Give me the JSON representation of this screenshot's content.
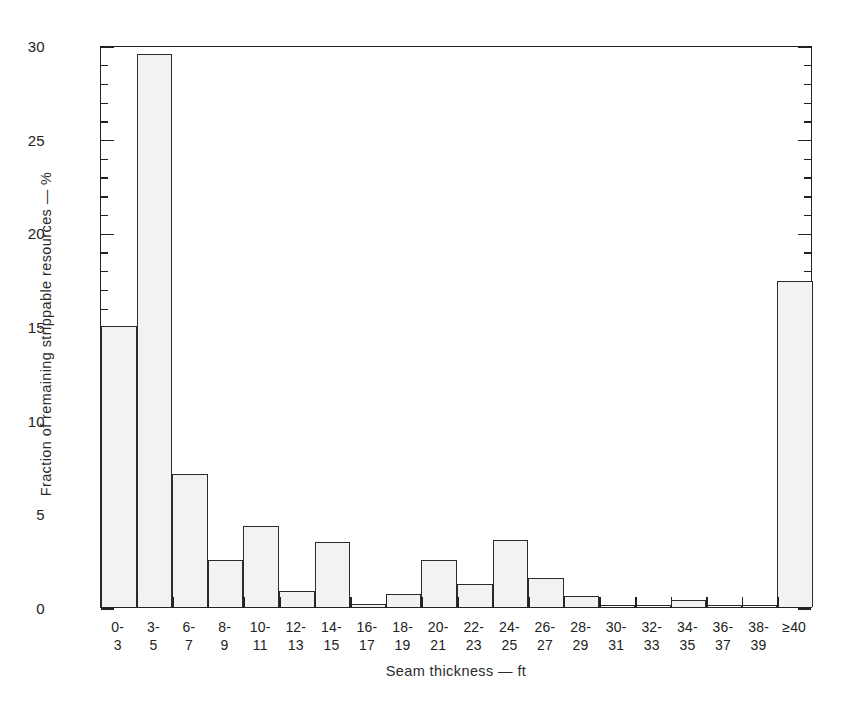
{
  "chart_data": {
    "type": "bar",
    "title": "",
    "xlabel": "Seam thickness — ft",
    "ylabel": "Fraction of remaining strippable resources — %",
    "ylim": [
      0,
      30
    ],
    "ytick_labels": [
      "0",
      "5",
      "10",
      "15",
      "20",
      "25",
      "30"
    ],
    "ytick_values": [
      0,
      5,
      10,
      15,
      20,
      25,
      30
    ],
    "yminor_step": 1,
    "grid": false,
    "legend": null,
    "categories": [
      "0-3",
      "3-5",
      "6-7",
      "8-9",
      "10-11",
      "12-13",
      "14-15",
      "16-17",
      "18-19",
      "20-21",
      "22-23",
      "24-25",
      "26-27",
      "28-29",
      "30-31",
      "32-33",
      "34-35",
      "36-37",
      "38-39",
      "≥40"
    ],
    "category_lines": [
      [
        "0-",
        "3"
      ],
      [
        "3-",
        "5"
      ],
      [
        "6-",
        "7"
      ],
      [
        "8-",
        "9"
      ],
      [
        "10-",
        "11"
      ],
      [
        "12-",
        "13"
      ],
      [
        "14-",
        "15"
      ],
      [
        "16-",
        "17"
      ],
      [
        "18-",
        "19"
      ],
      [
        "20-",
        "21"
      ],
      [
        "22-",
        "23"
      ],
      [
        "24-",
        "25"
      ],
      [
        "26-",
        "27"
      ],
      [
        "28-",
        "29"
      ],
      [
        "30-",
        "31"
      ],
      [
        "32-",
        "33"
      ],
      [
        "34-",
        "35"
      ],
      [
        "36-",
        "37"
      ],
      [
        "38-",
        "39"
      ],
      [
        "≥40",
        ""
      ]
    ],
    "values": [
      15.0,
      29.5,
      7.1,
      2.5,
      4.35,
      0.85,
      3.45,
      0.15,
      0.7,
      2.5,
      1.25,
      3.6,
      1.55,
      0.6,
      0.05,
      0.05,
      0.35,
      0.05,
      0.05,
      17.4
    ],
    "values_unit": "%",
    "bar_fill": "#f2f2f0",
    "bar_edge": "#2b2b2b",
    "axis_color": "#222222",
    "background": "#ffffff"
  }
}
